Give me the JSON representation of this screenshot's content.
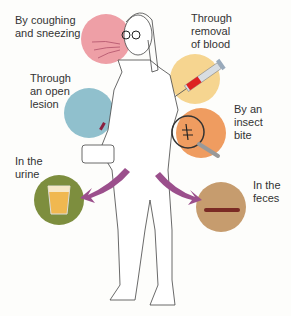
{
  "routes": [
    {
      "id": "cough",
      "label_lines": [
        "By coughing",
        "and sneezing"
      ],
      "color": "#ec9ea4",
      "icon": "breath-icon"
    },
    {
      "id": "lesion",
      "label_lines": [
        "Through",
        "an open",
        "lesion"
      ],
      "color": "#8fbfcc",
      "icon": "lesion-icon"
    },
    {
      "id": "blood",
      "label_lines": [
        "Through",
        "removal",
        "of blood"
      ],
      "color": "#f6d28e",
      "icon": "syringe-icon"
    },
    {
      "id": "insect",
      "label_lines": [
        "By an",
        "insect",
        "bite"
      ],
      "color": "#ef9a5e",
      "icon": "magnifier-insect-icon"
    },
    {
      "id": "urine",
      "label_lines": [
        "In the",
        "urine"
      ],
      "color": "#7a8c3c",
      "icon": "urine-cup-icon"
    },
    {
      "id": "feces",
      "label_lines": [
        "In the",
        "feces"
      ],
      "color": "#c49a6c",
      "icon": "feces-icon"
    }
  ],
  "arrow_color": "#9b4f8c"
}
